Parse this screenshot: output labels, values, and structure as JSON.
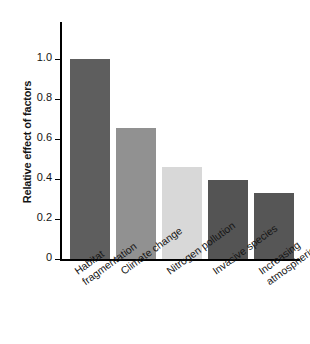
{
  "chart_data": {
    "type": "bar",
    "title": "",
    "xlabel": "",
    "ylabel": "Relative effect of factors",
    "categories": [
      "Habitat fragmentation",
      "Climate change",
      "Nitrogen pollution",
      "Invasive species",
      "Increasing atmospheric CO2"
    ],
    "values": [
      1.0,
      0.655,
      0.46,
      0.395,
      0.33
    ],
    "ylim": [
      0,
      1.185
    ],
    "yticks": [
      0,
      0.2,
      0.4,
      0.6,
      0.8,
      1.0
    ],
    "ytick_labels": [
      "0",
      "0.2",
      "0.4",
      "0.6",
      "0.8",
      "1.0"
    ],
    "grid": false,
    "legend": null,
    "bar_colors": [
      "#5e5e5e",
      "#919191",
      "#d8d8d8",
      "#545454",
      "#565656"
    ]
  },
  "axis": {
    "y_title": "Relative effect of factors",
    "ticks": [
      {
        "label": "1.0",
        "value": 1.0
      },
      {
        "label": "0.8",
        "value": 0.8
      },
      {
        "label": "0.6",
        "value": 0.6
      },
      {
        "label": "0.4",
        "value": 0.4
      },
      {
        "label": "0.2",
        "value": 0.2
      },
      {
        "label": "0",
        "value": 0
      }
    ]
  },
  "bars": [
    {
      "line1": "Habitat",
      "line2": "fragmentation",
      "value": 1.0,
      "color": "#5e5e5e"
    },
    {
      "line1": "Climate change",
      "line2": "",
      "value": 0.655,
      "color": "#919191"
    },
    {
      "line1": "Nitrogen pollution",
      "line2": "",
      "value": 0.46,
      "color": "#d8d8d8"
    },
    {
      "line1": "Invasive species",
      "line2": "",
      "value": 0.395,
      "color": "#545454"
    },
    {
      "line1": "Increasing",
      "line2": "atmospheric CO",
      "line2_sub": "2",
      "value": 0.33,
      "color": "#565656"
    }
  ]
}
